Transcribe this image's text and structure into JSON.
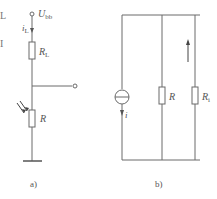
{
  "figure_a": {
    "caption": "a)",
    "supply_label": "U",
    "supply_sub": "bb",
    "current_label": "i",
    "current_sub": "L",
    "load_resistor_label": "R",
    "load_resistor_sub": "L",
    "photo_resistor_label": "R"
  },
  "figure_b": {
    "caption": "b)",
    "source_current_label": "i",
    "resistor_label": "R",
    "internal_resistor_label": "R",
    "internal_resistor_sub": "i"
  },
  "left_edge_fragments": [
    "L",
    "I"
  ],
  "colors": {
    "line": "#6a6a6a",
    "text": "#555555"
  }
}
